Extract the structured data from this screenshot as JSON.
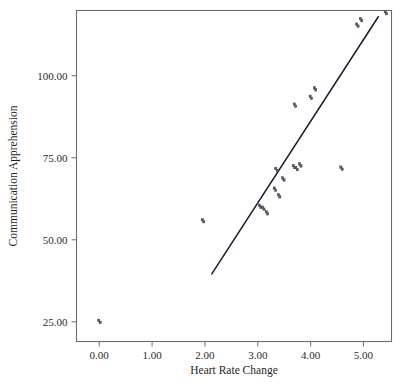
{
  "chart_data": {
    "type": "scatter",
    "title": "",
    "xlabel": "Heart Rate Change",
    "ylabel": "Communication Apprehension",
    "xlim": [
      -0.43,
      5.53
    ],
    "ylim": [
      19.0,
      119.9
    ],
    "grid": false,
    "legend": null,
    "xticks": [
      0.0,
      1.0,
      2.0,
      3.0,
      4.0,
      5.0
    ],
    "xtick_labels": [
      "0.00",
      "1.00",
      "2.00",
      "3.00",
      "4.00",
      "5.00"
    ],
    "yticks": [
      25.0,
      50.0,
      75.0,
      100.0
    ],
    "ytick_labels": [
      "25.00",
      "50.00",
      "75.00",
      "100.00"
    ],
    "marker": "small-square-glyph",
    "marker_color": "#5a5a66",
    "points": [
      {
        "x": 0.0,
        "y": 25.1
      },
      {
        "x": 1.96,
        "y": 55.8
      },
      {
        "x": 3.04,
        "y": 60.2
      },
      {
        "x": 3.1,
        "y": 59.6
      },
      {
        "x": 3.17,
        "y": 58.2
      },
      {
        "x": 3.32,
        "y": 65.4
      },
      {
        "x": 3.35,
        "y": 71.4
      },
      {
        "x": 3.4,
        "y": 63.4
      },
      {
        "x": 3.48,
        "y": 68.5
      },
      {
        "x": 3.68,
        "y": 72.3
      },
      {
        "x": 3.7,
        "y": 91.0
      },
      {
        "x": 3.73,
        "y": 71.7
      },
      {
        "x": 3.8,
        "y": 72.8
      },
      {
        "x": 4.0,
        "y": 93.4
      },
      {
        "x": 4.08,
        "y": 96.0
      },
      {
        "x": 4.58,
        "y": 71.8
      },
      {
        "x": 4.88,
        "y": 115.4
      },
      {
        "x": 4.95,
        "y": 117.1
      },
      {
        "x": 5.42,
        "y": 119.2
      }
    ],
    "fit_line": {
      "type": "linear-regression",
      "x_start": 2.13,
      "y_start": 39.6,
      "x_end": 5.28,
      "y_end": 118.0,
      "color": "#1a1a2e"
    }
  }
}
